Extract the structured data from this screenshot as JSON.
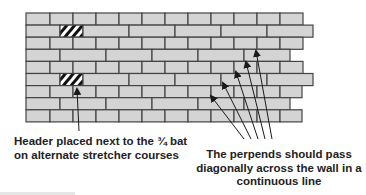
{
  "diagram": {
    "colors": {
      "brick": "#d4d4d4",
      "mortar": "#444444",
      "hatch": "#111111",
      "arrow": "#1a1a1a",
      "text": "#222222"
    },
    "wall": {
      "left": 26,
      "top": 13,
      "course_height": 12.1,
      "courses": [
        {
          "joints": [
            26,
            50,
            73,
            96,
            119,
            142,
            165,
            188,
            211,
            234,
            257,
            280,
            303
          ]
        },
        {
          "joints": [
            26,
            60,
            83,
            129,
            175,
            221,
            267,
            313
          ],
          "header_index": 1
        },
        {
          "joints": [
            26,
            50,
            73,
            96,
            119,
            142,
            165,
            188,
            211,
            234,
            257,
            280,
            303
          ]
        },
        {
          "joints": [
            26,
            60,
            106,
            152,
            198,
            244,
            290
          ]
        },
        {
          "joints": [
            26,
            50,
            73,
            96,
            119,
            142,
            165,
            188,
            211,
            234,
            257,
            280,
            303
          ]
        },
        {
          "joints": [
            26,
            60,
            83,
            129,
            175,
            221,
            267,
            313
          ],
          "header_index": 1
        },
        {
          "joints": [
            26,
            50,
            73,
            96,
            119,
            142,
            165,
            188,
            211,
            234,
            257,
            280,
            302
          ]
        },
        {
          "joints": [
            26,
            60,
            106,
            152,
            198,
            244,
            290
          ]
        },
        {
          "joints": [
            26,
            50,
            73,
            96,
            119,
            142,
            165,
            188,
            211,
            234,
            257,
            280,
            302
          ]
        }
      ]
    },
    "arrows": [
      {
        "from": [
          79,
          131
        ],
        "to": [
          77,
          89
        ]
      },
      {
        "from": [
          244,
          139
        ],
        "to": [
          211,
          96
        ]
      },
      {
        "from": [
          251,
          139
        ],
        "to": [
          223,
          83
        ]
      },
      {
        "from": [
          258,
          139
        ],
        "to": [
          236,
          72
        ]
      },
      {
        "from": [
          265,
          139
        ],
        "to": [
          246,
          62
        ]
      },
      {
        "from": [
          272,
          139
        ],
        "to": [
          256,
          51
        ]
      }
    ]
  },
  "labels": {
    "header_note_line1": "Header placed next to the ¾ bat",
    "header_note_line2": "on alternate stretcher courses",
    "perpends_note_line1": "The perpends should pass",
    "perpends_note_line2": "diagonally across the wall in a",
    "perpends_note_line3": "continuous line"
  }
}
